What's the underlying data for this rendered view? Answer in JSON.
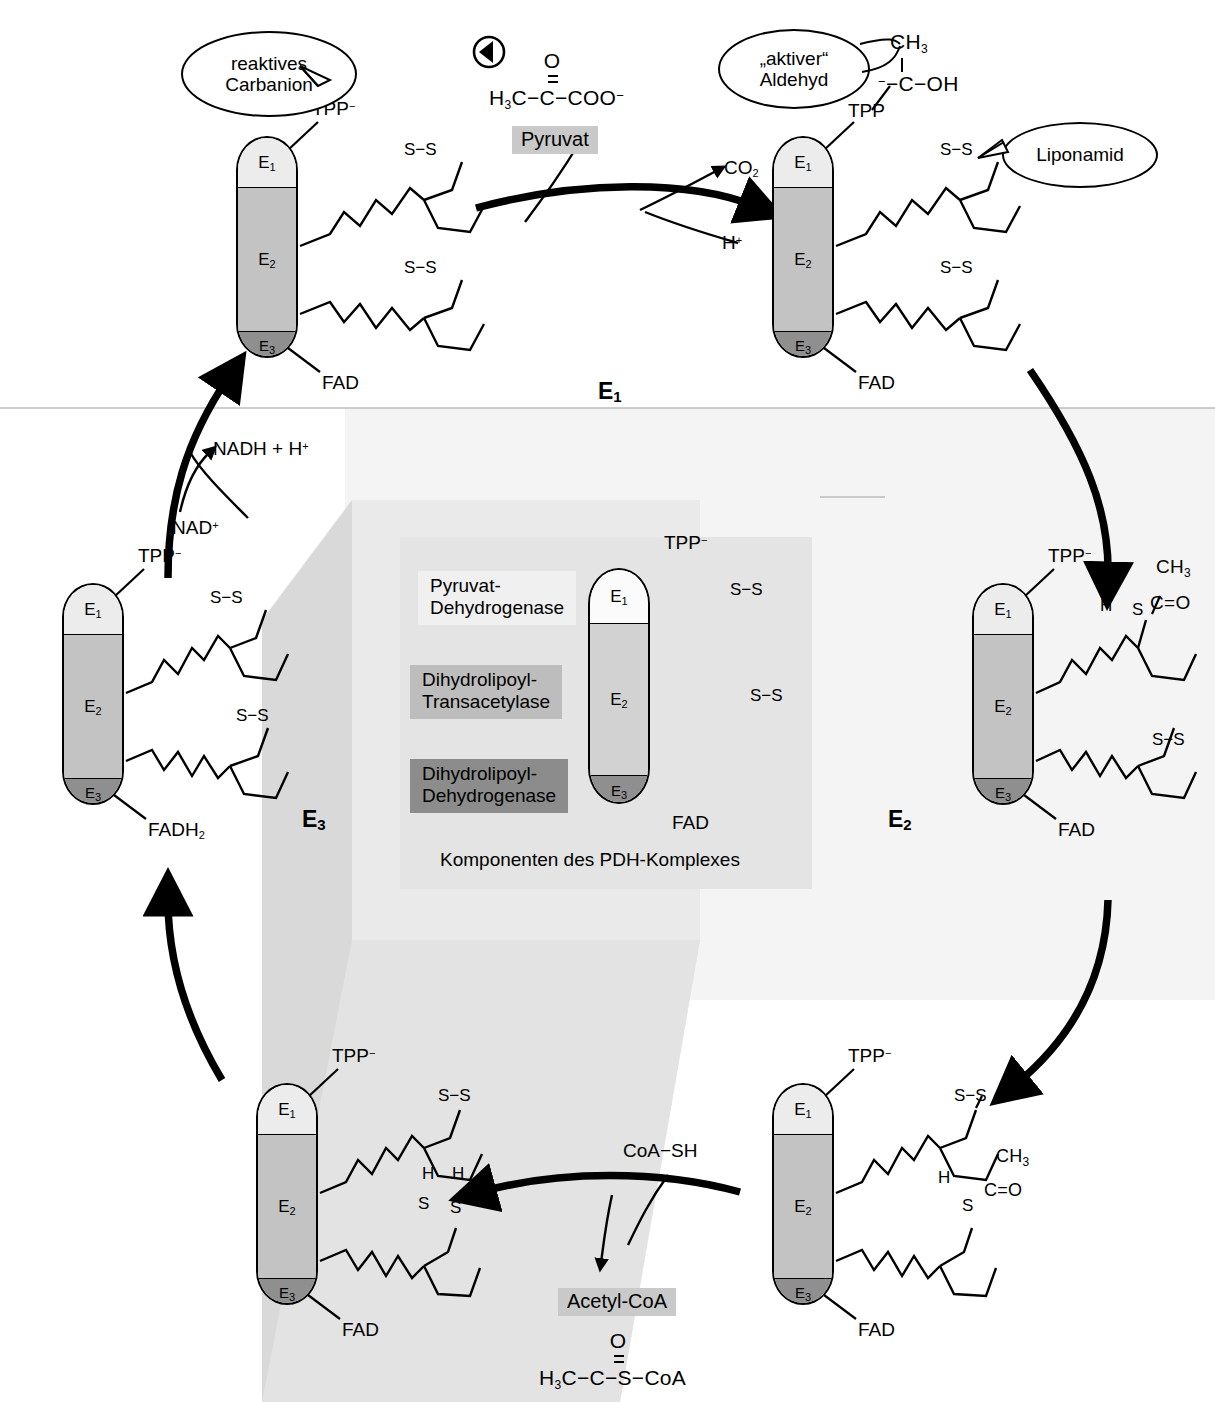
{
  "figure": {
    "title": "Komponenten des PDH-Komplexes",
    "marker_icon": "play-triangle-icon"
  },
  "colors": {
    "e1": "#ececec",
    "e2": "#c3c3c3",
    "e3": "#8f8f8f",
    "chip": "#c9c9c9",
    "legend_bg": "#e4e4e4",
    "outline": "#000000"
  },
  "complex_labels": {
    "e1": "E",
    "e1_sub": "1",
    "e2": "E",
    "e2_sub": "2",
    "e3": "E",
    "e3_sub": "3"
  },
  "stages": [
    {
      "name": "stage-e1",
      "label": "E",
      "sub": "1"
    },
    {
      "name": "stage-e2",
      "label": "E",
      "sub": "2"
    },
    {
      "name": "stage-e3",
      "label": "E",
      "sub": "3"
    }
  ],
  "cofactors": {
    "tpp_anion": "TPP",
    "tpp_anion_charge": "−",
    "tpp": "TPP",
    "fad": "FAD",
    "fadh2": "FADH",
    "fadh2_sub": "2"
  },
  "callouts": [
    {
      "name": "callout-carbanion",
      "line1": "reaktives",
      "line2": "Carbanion"
    },
    {
      "name": "callout-aktiver-aldehyd",
      "line1": "„aktiver“",
      "line2": "Aldehyd"
    },
    {
      "name": "callout-liponamid",
      "line1": "Liponamid"
    }
  ],
  "substrates": {
    "pyruvat_chip": "Pyruvat",
    "pyruvat_formula_pre": "H",
    "pyruvat_formula": "H₃C−C−COO⁻",
    "pyruvat_carbonyl": "O",
    "co2": "CO",
    "co2_sub": "2",
    "proton": "H",
    "proton_sup": "+",
    "nadh": "NADH + H",
    "nadh_sup": "+",
    "nad": "NAD",
    "nad_sup": "+",
    "coash": "CoA−SH",
    "acetylcoa_chip": "Acetyl-CoA",
    "acetylcoa_formula": "H₃C−C−S−CoA",
    "acetylcoa_carbonyl": "O"
  },
  "aldehyd_group": {
    "ch3": "CH",
    "ch3_sub": "3",
    "c_oh": "−C−OH",
    "minus": "−"
  },
  "acetyl_group": {
    "ch3": "CH",
    "ch3_sub": "3",
    "c_o": "C=O",
    "h": "H",
    "s": "S"
  },
  "lipoamide": {
    "oxidized": "S−S",
    "thiol_h": "H",
    "thiol_s": "S"
  },
  "legend": {
    "items": [
      {
        "name": "legend-e1",
        "line1": "Pyruvat-",
        "line2": "Dehydrogenase",
        "color": "#f0f0f0"
      },
      {
        "name": "legend-e2",
        "line1": "Dihydrolipoyl-",
        "line2": "Transacetylase",
        "color": "#bdbdbd"
      },
      {
        "name": "legend-e3",
        "line1": "Dihydrolipoyl-",
        "line2": "Dehydrogenase",
        "color": "#8c8c8c"
      }
    ],
    "caption": "Komponenten des PDH-Komplexes",
    "tpp": "TPP",
    "tpp_charge": "−",
    "fad": "FAD"
  }
}
